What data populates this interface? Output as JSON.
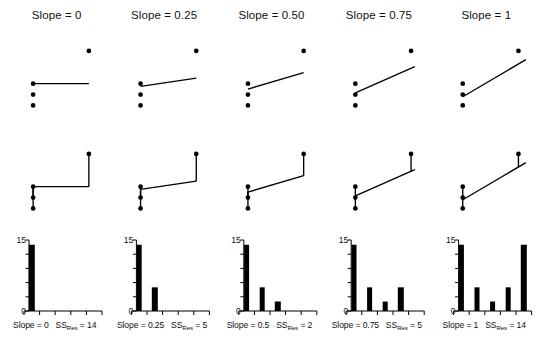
{
  "figure": {
    "width": 537,
    "height": 349,
    "background": "#ffffff",
    "ink": "#000000",
    "rows": 3,
    "columns": 5
  },
  "panel_titles": [
    "Slope = 0",
    "Slope = 0.25",
    "Slope = 0.50",
    "Slope = 0.75",
    "Slope = 1"
  ],
  "bottom_labels": [
    {
      "slope_text": "Slope = 0",
      "ss_prefix": "SS",
      "ss_subscript": "Res",
      "ss_text": " = 14"
    },
    {
      "slope_text": "Slope = 0.25",
      "ss_prefix": "SS",
      "ss_subscript": "Res",
      "ss_text": " = 5"
    },
    {
      "slope_text": "Slope = 0.5",
      "ss_prefix": "SS",
      "ss_subscript": "Res",
      "ss_text": " = 2"
    },
    {
      "slope_text": "Slope = 0.75",
      "ss_prefix": "SS",
      "ss_subscript": "Res",
      "ss_text": " = 5"
    },
    {
      "slope_text": "Slope = 1",
      "ss_prefix": "SS",
      "ss_subscript": "Res",
      "ss_text": " = 14"
    }
  ],
  "histogram_y_ticks": {
    "top_label": "15",
    "bottom_label": "0"
  },
  "chart_data": [
    {
      "type": "scatter",
      "title": "Slope = 0",
      "panel_row": "scatter",
      "panel_index": 0,
      "points": [
        {
          "x": 1,
          "y": 2
        },
        {
          "x": 1,
          "y": 1
        },
        {
          "x": 1,
          "y": 0
        },
        {
          "x": 4,
          "y": 5
        }
      ],
      "fit_line": {
        "slope": 0,
        "intercept": 2,
        "x_from": 1,
        "x_to": 4
      },
      "xlabel": "",
      "ylabel": "",
      "xlim": [
        0.4,
        4.6
      ],
      "ylim": [
        -0.6,
        6.0
      ],
      "grid": false,
      "legend": false
    },
    {
      "type": "scatter",
      "title": "Slope = 0.25",
      "panel_row": "scatter",
      "panel_index": 1,
      "points": [
        {
          "x": 1,
          "y": 2
        },
        {
          "x": 1,
          "y": 1
        },
        {
          "x": 1,
          "y": 0
        },
        {
          "x": 4,
          "y": 5
        }
      ],
      "fit_line": {
        "slope": 0.25,
        "intercept": 1.5,
        "x_from": 1,
        "x_to": 4
      },
      "xlabel": "",
      "ylabel": "",
      "xlim": [
        0.4,
        4.6
      ],
      "ylim": [
        -0.6,
        6.0
      ],
      "grid": false,
      "legend": false
    },
    {
      "type": "scatter",
      "title": "Slope = 0.50",
      "panel_row": "scatter",
      "panel_index": 2,
      "points": [
        {
          "x": 1,
          "y": 2
        },
        {
          "x": 1,
          "y": 1
        },
        {
          "x": 1,
          "y": 0
        },
        {
          "x": 4,
          "y": 5
        }
      ],
      "fit_line": {
        "slope": 0.5,
        "intercept": 1.0,
        "x_from": 1,
        "x_to": 4
      },
      "xlabel": "",
      "ylabel": "",
      "xlim": [
        0.4,
        4.6
      ],
      "ylim": [
        -0.6,
        6.0
      ],
      "grid": false,
      "legend": false
    },
    {
      "type": "scatter",
      "title": "Slope = 0.75",
      "panel_row": "scatter",
      "panel_index": 3,
      "points": [
        {
          "x": 1,
          "y": 2
        },
        {
          "x": 1,
          "y": 1
        },
        {
          "x": 1,
          "y": 0
        },
        {
          "x": 4,
          "y": 5
        }
      ],
      "fit_line": {
        "slope": 0.75,
        "intercept": 0.4,
        "x_from": 1,
        "x_to": 4.2
      },
      "xlabel": "",
      "ylabel": "",
      "xlim": [
        0.4,
        4.6
      ],
      "ylim": [
        -0.6,
        6.0
      ],
      "grid": false,
      "legend": false
    },
    {
      "type": "scatter",
      "title": "Slope = 1",
      "panel_row": "scatter",
      "panel_index": 4,
      "points": [
        {
          "x": 1,
          "y": 2
        },
        {
          "x": 1,
          "y": 1
        },
        {
          "x": 1,
          "y": 0
        },
        {
          "x": 4,
          "y": 5
        }
      ],
      "fit_line": {
        "slope": 1.0,
        "intercept": -0.2,
        "x_from": 1,
        "x_to": 4.4
      },
      "xlabel": "",
      "ylabel": "",
      "xlim": [
        0.4,
        4.6
      ],
      "ylim": [
        -0.6,
        6.0
      ],
      "grid": false,
      "legend": false
    },
    {
      "type": "scatter",
      "panel_row": "residual",
      "panel_index": 0,
      "points": [
        {
          "x": 1,
          "y": 2
        },
        {
          "x": 1,
          "y": 1
        },
        {
          "x": 1,
          "y": 0
        },
        {
          "x": 4,
          "y": 5
        }
      ],
      "fit_line": {
        "slope": 0,
        "intercept": 2,
        "x_from": 1,
        "x_to": 4
      },
      "residuals": [
        {
          "x": 1,
          "y_point": 2,
          "y_fit": 2
        },
        {
          "x": 1,
          "y_point": 1,
          "y_fit": 2
        },
        {
          "x": 1,
          "y_point": 0,
          "y_fit": 2
        },
        {
          "x": 4,
          "y_point": 5,
          "y_fit": 2
        }
      ],
      "ss_res": 14,
      "xlim": [
        0.4,
        4.6
      ],
      "ylim": [
        -0.6,
        6.0
      ],
      "grid": false,
      "legend": false
    },
    {
      "type": "scatter",
      "panel_row": "residual",
      "panel_index": 1,
      "points": [
        {
          "x": 1,
          "y": 2
        },
        {
          "x": 1,
          "y": 1
        },
        {
          "x": 1,
          "y": 0
        },
        {
          "x": 4,
          "y": 5
        }
      ],
      "fit_line": {
        "slope": 0.25,
        "intercept": 1.5,
        "x_from": 1,
        "x_to": 4
      },
      "residuals": [
        {
          "x": 1,
          "y_point": 2,
          "y_fit": 1.75
        },
        {
          "x": 1,
          "y_point": 1,
          "y_fit": 1.75
        },
        {
          "x": 1,
          "y_point": 0,
          "y_fit": 1.75
        },
        {
          "x": 4,
          "y_point": 5,
          "y_fit": 2.5
        }
      ],
      "ss_res": 5,
      "xlim": [
        0.4,
        4.6
      ],
      "ylim": [
        -0.6,
        6.0
      ],
      "grid": false,
      "legend": false
    },
    {
      "type": "scatter",
      "panel_row": "residual",
      "panel_index": 2,
      "points": [
        {
          "x": 1,
          "y": 2
        },
        {
          "x": 1,
          "y": 1
        },
        {
          "x": 1,
          "y": 0
        },
        {
          "x": 4,
          "y": 5
        }
      ],
      "fit_line": {
        "slope": 0.5,
        "intercept": 1.0,
        "x_from": 1,
        "x_to": 4
      },
      "residuals": [
        {
          "x": 1,
          "y_point": 2,
          "y_fit": 1.5
        },
        {
          "x": 1,
          "y_point": 1,
          "y_fit": 1.5
        },
        {
          "x": 1,
          "y_point": 0,
          "y_fit": 1.5
        },
        {
          "x": 4,
          "y_point": 5,
          "y_fit": 3.0
        }
      ],
      "ss_res": 2,
      "xlim": [
        0.4,
        4.6
      ],
      "ylim": [
        -0.6,
        6.0
      ],
      "grid": false,
      "legend": false
    },
    {
      "type": "scatter",
      "panel_row": "residual",
      "panel_index": 3,
      "points": [
        {
          "x": 1,
          "y": 2
        },
        {
          "x": 1,
          "y": 1
        },
        {
          "x": 1,
          "y": 0
        },
        {
          "x": 4,
          "y": 5
        }
      ],
      "fit_line": {
        "slope": 0.75,
        "intercept": 0.4,
        "x_from": 1,
        "x_to": 4.2
      },
      "residuals": [
        {
          "x": 1,
          "y_point": 2,
          "y_fit": 1.15
        },
        {
          "x": 1,
          "y_point": 1,
          "y_fit": 1.15
        },
        {
          "x": 1,
          "y_point": 0,
          "y_fit": 1.15
        },
        {
          "x": 4,
          "y_point": 5,
          "y_fit": 3.4
        }
      ],
      "ss_res": 5,
      "xlim": [
        0.4,
        4.6
      ],
      "ylim": [
        -0.6,
        6.0
      ],
      "grid": false,
      "legend": false
    },
    {
      "type": "scatter",
      "panel_row": "residual",
      "panel_index": 4,
      "points": [
        {
          "x": 1,
          "y": 2
        },
        {
          "x": 1,
          "y": 1
        },
        {
          "x": 1,
          "y": 0
        },
        {
          "x": 4,
          "y": 5
        }
      ],
      "fit_line": {
        "slope": 1.0,
        "intercept": -0.2,
        "x_from": 1,
        "x_to": 4.4
      },
      "residuals": [
        {
          "x": 1,
          "y_point": 2,
          "y_fit": 0.8
        },
        {
          "x": 1,
          "y_point": 1,
          "y_fit": 0.8
        },
        {
          "x": 1,
          "y_point": 0,
          "y_fit": 0.8
        },
        {
          "x": 4,
          "y_point": 5,
          "y_fit": 3.8
        }
      ],
      "ss_res": 14,
      "xlim": [
        0.4,
        4.6
      ],
      "ylim": [
        -0.6,
        6.0
      ],
      "grid": false,
      "legend": false
    },
    {
      "type": "bar",
      "panel_row": "histogram",
      "panel_index": 0,
      "categories": [
        "0",
        "0.25",
        "0.5",
        "0.75",
        "1"
      ],
      "values": [
        14,
        0,
        0,
        0,
        0
      ],
      "highlight_category": "0",
      "highlight_value": 14,
      "title": "",
      "xlabel": "Slope = 0   SS_Res = 14",
      "ylabel": "",
      "ylim": [
        0,
        15
      ],
      "ytick_labels": [
        "0",
        "15"
      ],
      "ytick_count": 6,
      "xtick_count": 6,
      "grid": false,
      "legend": false
    },
    {
      "type": "bar",
      "panel_row": "histogram",
      "panel_index": 1,
      "categories": [
        "0",
        "0.25",
        "0.5",
        "0.75",
        "1"
      ],
      "values": [
        14,
        5,
        0,
        0,
        0
      ],
      "highlight_category": "0.25",
      "highlight_value": 5,
      "title": "",
      "xlabel": "Slope = 0.25   SS_Res = 5",
      "ylabel": "",
      "ylim": [
        0,
        15
      ],
      "ytick_labels": [
        "0",
        "15"
      ],
      "ytick_count": 6,
      "xtick_count": 6,
      "grid": false,
      "legend": false
    },
    {
      "type": "bar",
      "panel_row": "histogram",
      "panel_index": 2,
      "categories": [
        "0",
        "0.25",
        "0.5",
        "0.75",
        "1"
      ],
      "values": [
        14,
        5,
        2,
        0,
        0
      ],
      "highlight_category": "0.5",
      "highlight_value": 2,
      "title": "",
      "xlabel": "Slope = 0.5   SS_Res = 2",
      "ylabel": "",
      "ylim": [
        0,
        15
      ],
      "ytick_labels": [
        "0",
        "15"
      ],
      "ytick_count": 6,
      "xtick_count": 6,
      "grid": false,
      "legend": false
    },
    {
      "type": "bar",
      "panel_row": "histogram",
      "panel_index": 3,
      "categories": [
        "0",
        "0.25",
        "0.5",
        "0.75",
        "1"
      ],
      "values": [
        14,
        5,
        2,
        5,
        0
      ],
      "highlight_category": "0.75",
      "highlight_value": 5,
      "title": "",
      "xlabel": "Slope = 0.75   SS_Res = 5",
      "ylabel": "",
      "ylim": [
        0,
        15
      ],
      "ytick_labels": [
        "0",
        "15"
      ],
      "ytick_count": 6,
      "xtick_count": 6,
      "grid": false,
      "legend": false
    },
    {
      "type": "bar",
      "panel_row": "histogram",
      "panel_index": 4,
      "categories": [
        "0",
        "0.25",
        "0.5",
        "0.75",
        "1"
      ],
      "values": [
        14,
        5,
        2,
        5,
        14
      ],
      "highlight_category": "1",
      "highlight_value": 14,
      "title": "",
      "xlabel": "Slope = 1   SS_Res = 14",
      "ylabel": "",
      "ylim": [
        0,
        15
      ],
      "ytick_labels": [
        "0",
        "15"
      ],
      "ytick_count": 6,
      "xtick_count": 6,
      "grid": false,
      "legend": false
    }
  ]
}
